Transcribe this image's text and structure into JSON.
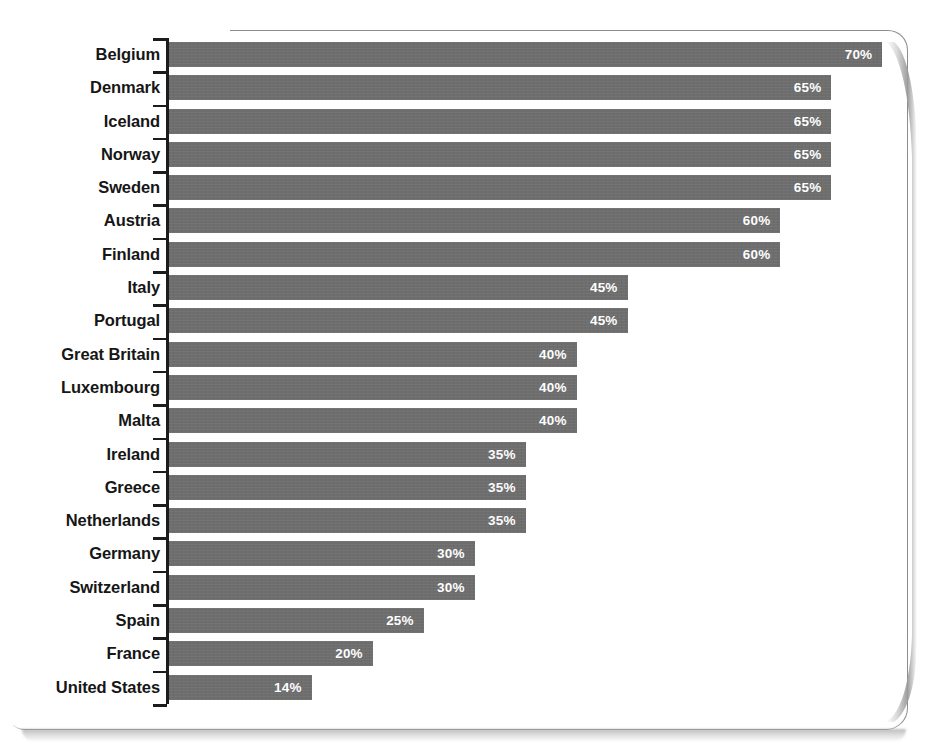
{
  "chart_data": {
    "type": "bar",
    "orientation": "horizontal",
    "title": "",
    "subtitle": "",
    "xlabel": "",
    "ylabel": "",
    "xlim": [
      0,
      70
    ],
    "grid": false,
    "legend": null,
    "value_suffix": "%",
    "bar_color": "#6e6e6e",
    "label_color": "#ffffff",
    "axis_color": "#1c1c1c",
    "categories": [
      "Belgium",
      "Denmark",
      "Iceland",
      "Norway",
      "Sweden",
      "Austria",
      "Finland",
      "Italy",
      "Portugal",
      "Great Britain",
      "Luxembourg",
      "Malta",
      "Ireland",
      "Greece",
      "Netherlands",
      "Germany",
      "Switzerland",
      "Spain",
      "France",
      "United States"
    ],
    "values": [
      70,
      65,
      65,
      65,
      65,
      60,
      60,
      45,
      45,
      40,
      40,
      40,
      35,
      35,
      35,
      30,
      30,
      25,
      20,
      14
    ],
    "value_labels": [
      "70%",
      "65%",
      "65%",
      "65%",
      "65%",
      "60%",
      "60%",
      "45%",
      "45%",
      "40%",
      "40%",
      "40%",
      "35%",
      "35%",
      "35%",
      "30%",
      "30%",
      "25%",
      "20%",
      "14%"
    ],
    "bars": [
      {
        "category": "Belgium",
        "value": 70,
        "label": "70%"
      },
      {
        "category": "Denmark",
        "value": 65,
        "label": "65%"
      },
      {
        "category": "Iceland",
        "value": 65,
        "label": "65%"
      },
      {
        "category": "Norway",
        "value": 65,
        "label": "65%"
      },
      {
        "category": "Sweden",
        "value": 65,
        "label": "65%"
      },
      {
        "category": "Austria",
        "value": 60,
        "label": "60%"
      },
      {
        "category": "Finland",
        "value": 60,
        "label": "60%"
      },
      {
        "category": "Italy",
        "value": 45,
        "label": "45%"
      },
      {
        "category": "Portugal",
        "value": 45,
        "label": "45%"
      },
      {
        "category": "Great Britain",
        "value": 40,
        "label": "40%"
      },
      {
        "category": "Luxembourg",
        "value": 40,
        "label": "40%"
      },
      {
        "category": "Malta",
        "value": 40,
        "label": "40%"
      },
      {
        "category": "Ireland",
        "value": 35,
        "label": "35%"
      },
      {
        "category": "Greece",
        "value": 35,
        "label": "35%"
      },
      {
        "category": "Netherlands",
        "value": 35,
        "label": "35%"
      },
      {
        "category": "Germany",
        "value": 30,
        "label": "30%"
      },
      {
        "category": "Switzerland",
        "value": 30,
        "label": "30%"
      },
      {
        "category": "Spain",
        "value": 25,
        "label": "25%"
      },
      {
        "category": "France",
        "value": 20,
        "label": "20%"
      },
      {
        "category": "United States",
        "value": 14,
        "label": "14%"
      }
    ]
  }
}
